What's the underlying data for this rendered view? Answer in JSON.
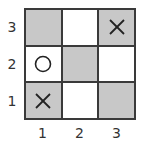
{
  "board": {
    "rows": 3,
    "cols": 3,
    "row_labels": [
      "3",
      "2",
      "1"
    ],
    "col_labels": [
      "1",
      "2",
      "3"
    ],
    "colors": {
      "grey": "#c8c8c8",
      "white": "#ffffff",
      "line": "#3a3a3a",
      "mark": "#222222"
    },
    "cells": [
      [
        {
          "fill": "grey",
          "mark": ""
        },
        {
          "fill": "white",
          "mark": ""
        },
        {
          "fill": "grey",
          "mark": "X"
        }
      ],
      [
        {
          "fill": "white",
          "mark": "O"
        },
        {
          "fill": "grey",
          "mark": ""
        },
        {
          "fill": "white",
          "mark": ""
        }
      ],
      [
        {
          "fill": "grey",
          "mark": "X"
        },
        {
          "fill": "white",
          "mark": ""
        },
        {
          "fill": "grey",
          "mark": ""
        }
      ]
    ]
  }
}
